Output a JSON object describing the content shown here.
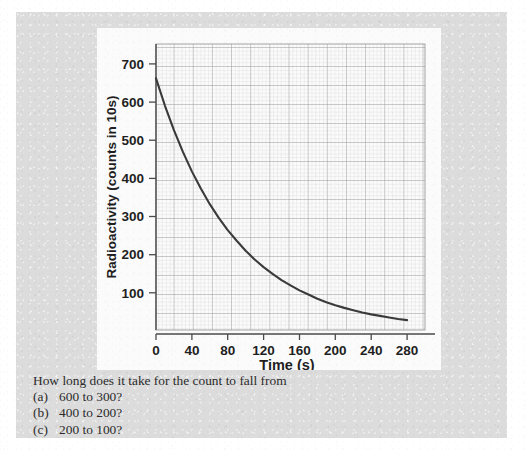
{
  "page": {
    "background_color": "#dcdcdc",
    "panel_color": "#fbfbfb"
  },
  "chart_data": {
    "type": "line",
    "title": "",
    "xlabel": "Time (s)",
    "ylabel": "Radioactivity (counts in 10s)",
    "xlim": [
      0,
      300
    ],
    "ylim": [
      0,
      750
    ],
    "xticks": [
      0,
      40,
      80,
      120,
      160,
      200,
      240,
      280
    ],
    "xtick_labels": [
      "0",
      "40",
      "80",
      "120",
      "160",
      "200",
      "240",
      "280"
    ],
    "yticks": [
      100,
      200,
      300,
      400,
      500,
      600,
      700
    ],
    "ytick_labels": [
      "100",
      "200",
      "300",
      "400",
      "500",
      "600",
      "700"
    ],
    "grid": true,
    "grid_minor_step_x": 5,
    "grid_minor_step_y": 10,
    "grid_major_step_x": 25,
    "grid_major_step_y": 50,
    "legend": null,
    "curve_color": "#3a3a3a",
    "series": [
      {
        "name": "Radioactive decay",
        "model": "exponential",
        "initial_value": 660,
        "half_life_s": 60,
        "x": [
          0,
          10,
          20,
          30,
          40,
          50,
          60,
          70,
          80,
          90,
          100,
          110,
          120,
          130,
          140,
          150,
          160,
          170,
          180,
          190,
          200,
          210,
          220,
          230,
          240,
          250,
          260,
          270,
          280
        ],
        "y": [
          660,
          588,
          524,
          467,
          416,
          371,
          330,
          294,
          262,
          234,
          208,
          185,
          165,
          147,
          131,
          117,
          104,
          93,
          82,
          73,
          65,
          58,
          52,
          46,
          41,
          37,
          33,
          29,
          26
        ]
      }
    ]
  },
  "question": {
    "prompt": "How long does it take for the count to fall from",
    "items": [
      {
        "marker": "(a)",
        "text": "600 to 300?"
      },
      {
        "marker": "(b)",
        "text": "400 to 200?"
      },
      {
        "marker": "(c)",
        "text": "200 to 100?"
      }
    ]
  }
}
